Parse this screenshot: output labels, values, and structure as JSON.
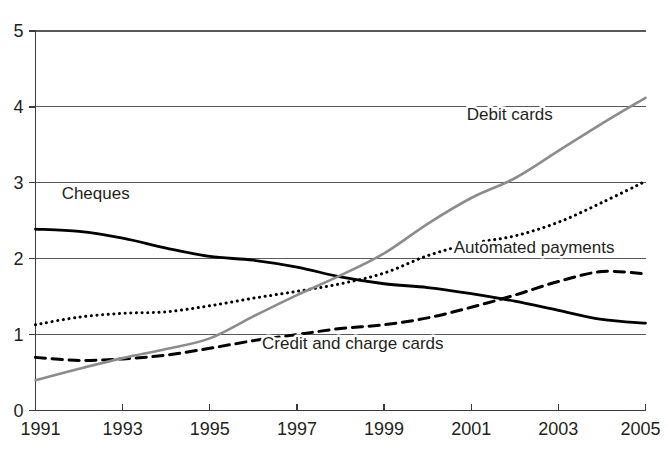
{
  "chart_data": {
    "type": "line",
    "title": "",
    "subtitle": "",
    "xlabel": "",
    "ylabel": "",
    "xlim": [
      1991,
      2005
    ],
    "ylim": [
      0,
      5
    ],
    "grid": true,
    "gridlines_y": [
      1,
      2,
      3,
      4,
      5
    ],
    "legend_position": "inline-labels",
    "x": [
      1991,
      1992,
      1993,
      1994,
      1995,
      1996,
      1997,
      1998,
      1999,
      2000,
      2001,
      2002,
      2003,
      2004,
      2005
    ],
    "xtick_labels": [
      "1991",
      "1993",
      "1995",
      "1997",
      "1999",
      "2001",
      "2003",
      "2005"
    ],
    "xtick_values": [
      1991,
      1993,
      1995,
      1997,
      1999,
      2001,
      2003,
      2005
    ],
    "ytick_labels": [
      "0",
      "1",
      "2",
      "3",
      "4",
      "5"
    ],
    "ytick_values": [
      0,
      1,
      2,
      3,
      4,
      5
    ],
    "series": [
      {
        "name": "Cheques",
        "label": "Cheques",
        "style": "solid",
        "color": "#000000",
        "width": 2.8,
        "label_x": 1991.6,
        "label_y": 2.78,
        "label_anchor": "start",
        "values": [
          2.39,
          2.36,
          2.27,
          2.14,
          2.03,
          1.98,
          1.89,
          1.76,
          1.67,
          1.62,
          1.54,
          1.44,
          1.32,
          1.2,
          1.15
        ]
      },
      {
        "name": "Automated payments",
        "label": "Automated payments",
        "style": "dotted",
        "color": "#000000",
        "width": 3.0,
        "label_x": 2000.6,
        "label_y": 2.07,
        "label_anchor": "start",
        "values": [
          1.13,
          1.23,
          1.28,
          1.3,
          1.38,
          1.48,
          1.57,
          1.67,
          1.81,
          2.04,
          2.2,
          2.3,
          2.48,
          2.74,
          3.02
        ]
      },
      {
        "name": "Credit and charge cards",
        "label": "Credit and charge cards",
        "style": "dashed",
        "color": "#000000",
        "width": 3.0,
        "label_x": 1996.2,
        "label_y": 0.81,
        "label_anchor": "start",
        "values": [
          0.7,
          0.66,
          0.68,
          0.73,
          0.82,
          0.92,
          1.0,
          1.08,
          1.13,
          1.22,
          1.36,
          1.52,
          1.7,
          1.83,
          1.8
        ]
      },
      {
        "name": "Debit cards",
        "label": "Debit cards",
        "style": "solid",
        "color": "#8c8c8c",
        "width": 2.6,
        "label_x": 2000.9,
        "label_y": 3.83,
        "label_anchor": "start",
        "values": [
          0.4,
          0.55,
          0.69,
          0.81,
          0.95,
          1.24,
          1.52,
          1.78,
          2.07,
          2.46,
          2.8,
          3.06,
          3.42,
          3.78,
          4.12
        ]
      }
    ]
  },
  "colors": {
    "background": "#ffffff",
    "axis": "#3a3a3c",
    "grid": "#58595b",
    "text": "#231f20",
    "series_black": "#000000",
    "series_grey": "#8c8c8c"
  }
}
